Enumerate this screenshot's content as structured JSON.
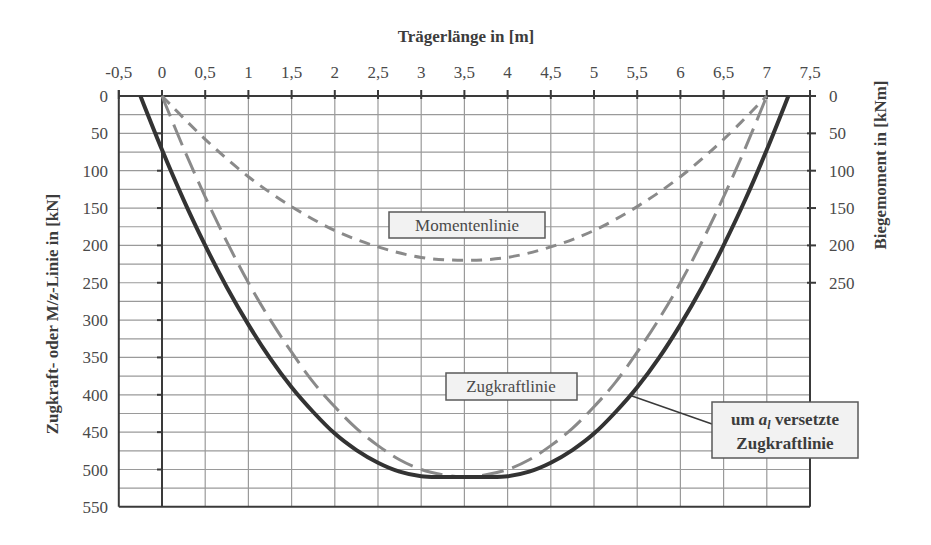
{
  "chart_data": {
    "type": "line",
    "title": "",
    "xlabel": "Trägerlänge in [m]",
    "ylabel_left": "Zugkraft- oder M/z-Linie in [kN]",
    "ylabel_right": "Biegemoment in [kNm]",
    "x_axis_position": "top",
    "y_axis_inverted": true,
    "xlim": [
      -0.5,
      7.5
    ],
    "ylim_left": [
      0,
      550
    ],
    "ylim_right": [
      0,
      250
    ],
    "x_ticks": [
      "-0,5",
      "0",
      "0,5",
      "1",
      "1,5",
      "2",
      "2,5",
      "3",
      "3,5",
      "4",
      "4,5",
      "5",
      "5,5",
      "6",
      "6,5",
      "7",
      "7,5"
    ],
    "x_tick_values": [
      -0.5,
      0,
      0.5,
      1,
      1.5,
      2,
      2.5,
      3,
      3.5,
      4,
      4.5,
      5,
      5.5,
      6,
      6.5,
      7,
      7.5
    ],
    "y_ticks_left": [
      "0",
      "50",
      "100",
      "150",
      "200",
      "250",
      "300",
      "350",
      "400",
      "450",
      "500",
      "550"
    ],
    "y_tick_values_left": [
      0,
      50,
      100,
      150,
      200,
      250,
      300,
      350,
      400,
      450,
      500,
      550
    ],
    "y_ticks_right": [
      "0",
      "50",
      "100",
      "150",
      "200",
      "250"
    ],
    "y_tick_values_right": [
      0,
      50,
      100,
      150,
      200,
      250
    ],
    "grid": {
      "x_step": 0.5,
      "y_step": 25,
      "on": true
    },
    "series": [
      {
        "name": "Momentenlinie",
        "axis": "right",
        "style": "short-dash",
        "color": "#8a8a8a",
        "x": [
          0,
          0.5,
          1,
          1.5,
          2,
          2.5,
          3,
          3.5,
          4,
          4.5,
          5,
          5.5,
          6,
          6.5,
          7
        ],
        "values": [
          0,
          58,
          108,
          148,
          180,
          202,
          216,
          220,
          216,
          202,
          180,
          148,
          108,
          58,
          0
        ]
      },
      {
        "name": "Zugkraftlinie",
        "axis": "left",
        "style": "long-dash",
        "color": "#8a8a8a",
        "x": [
          0,
          0.25,
          0.5,
          0.75,
          1,
          1.25,
          1.5,
          1.75,
          2,
          2.25,
          2.5,
          2.75,
          3,
          3.25,
          3.5,
          3.75,
          4,
          4.25,
          4.5,
          4.75,
          5,
          5.25,
          5.5,
          5.75,
          6,
          6.25,
          6.5,
          6.75,
          7
        ],
        "values": [
          0,
          70,
          135,
          195,
          250,
          299,
          343,
          383,
          416,
          445,
          468,
          487,
          500,
          507,
          510,
          507,
          500,
          487,
          468,
          445,
          416,
          383,
          343,
          299,
          250,
          195,
          135,
          70,
          0
        ]
      },
      {
        "name": "um a1 versetzte Zugkraftlinie",
        "axis": "left",
        "style": "solid",
        "color": "#333333",
        "x": [
          -0.25,
          0,
          0.25,
          0.5,
          0.75,
          1,
          1.25,
          1.5,
          1.75,
          2,
          2.25,
          2.5,
          2.75,
          3,
          3.25,
          3.5,
          3.75,
          4,
          4.25,
          4.5,
          4.75,
          5,
          5.25,
          5.5,
          5.75,
          6,
          6.25,
          6.5,
          6.75,
          7,
          7.25
        ],
        "values": [
          0,
          72,
          139,
          200,
          256,
          306,
          351,
          390,
          423,
          452,
          474,
          491,
          503,
          509,
          510,
          510,
          510,
          509,
          503,
          491,
          474,
          452,
          423,
          390,
          351,
          306,
          256,
          200,
          139,
          72,
          0
        ]
      }
    ],
    "annotations": [
      {
        "text": "Momentenlinie",
        "boxed": true
      },
      {
        "text": "Zugkraftlinie",
        "boxed": true
      },
      {
        "text_line1_prefix": "um ",
        "text_line1_var": "a",
        "text_line1_sub": "l",
        "text_line1_suffix": " versetzte",
        "text_line2": "Zugkraftlinie",
        "boxed": true,
        "leader_line": true
      }
    ]
  },
  "labels": {
    "x_title": "Trägerlänge in [m]",
    "y_left_title": "Zugkraft- oder M/z-Linie in [kN]",
    "y_right_title": "Biegemoment in [kNm]",
    "moment_label": "Momentenlinie",
    "zug_label": "Zugkraftlinie",
    "callout_prefix": "um ",
    "callout_var": "a",
    "callout_sub": "l",
    "callout_suffix": " versetzte",
    "callout_line2": "Zugkraftlinie"
  },
  "colors": {
    "grid": "#9a9a9a",
    "axis": "#3a3a3a",
    "dashed": "#8a8a8a",
    "solid": "#333333",
    "label_box_fill": "#f2f2f2"
  }
}
